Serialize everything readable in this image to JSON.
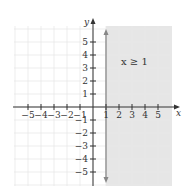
{
  "chart_data": {
    "type": "line",
    "title": "",
    "xlabel": "x",
    "ylabel": "y",
    "xlim": [
      -6,
      6
    ],
    "ylim": [
      -6,
      6
    ],
    "grid": true,
    "x_ticks": [
      -5,
      -4,
      -3,
      -2,
      -1,
      1,
      2,
      3,
      4,
      5
    ],
    "y_ticks": [
      -5,
      -4,
      -3,
      -2,
      -1,
      1,
      2,
      3,
      4,
      5
    ],
    "x_tick_labels": [
      "−5",
      "−4",
      "−3",
      "−2",
      "−1",
      "1",
      "2",
      "3",
      "4",
      "5"
    ],
    "y_tick_labels": [
      "−5",
      "−4",
      "−3",
      "−2",
      "−1",
      "1",
      "2",
      "3",
      "4",
      "5"
    ],
    "boundary_line": {
      "equation": "x = 1",
      "style": "solid",
      "arrows": "both"
    },
    "shaded_region": {
      "inequality": "x ≥ 1",
      "side": "right"
    },
    "annotation": "x ≥ 1",
    "colors": {
      "shade": "#e6e6e6",
      "grid": "#e8e8e8",
      "axis": "#333333",
      "boundary": "#888888"
    }
  },
  "labels": {
    "x_axis": "x",
    "y_axis": "y",
    "inequality": "x ≥ 1"
  }
}
